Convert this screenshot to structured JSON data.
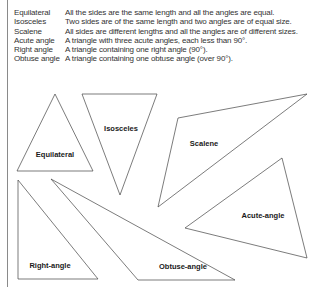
{
  "definitions": [
    {
      "term": "Equilateral",
      "description": "All the sides are the same length and all the angles are equal."
    },
    {
      "term": "Isosceles",
      "description": "Two sides are of the same length and two angles are of equal size."
    },
    {
      "term": "Scalene",
      "description": "All sides are different lengths and all the angles are of different sizes."
    },
    {
      "term": "Acute angle",
      "description": "A triangle with three acute angles, each less than 90°."
    },
    {
      "term": "Right angle",
      "description": "A triangle containing one right angle (90°)."
    },
    {
      "term": "Obtuse angle",
      "description": "A triangle containing one obtuse angle (over 90°)."
    }
  ],
  "triangles": {
    "equilateral": {
      "label": "Equilateral",
      "points": "55,94 17,171 93,171"
    },
    "isosceles": {
      "label": "Isosceles",
      "points": "82,94 157,94 120,195"
    },
    "scalene": {
      "label": "Scalene",
      "points": "178,118 307,94 158,207"
    },
    "acute": {
      "label": "Acute-angle",
      "points": "282,158 185,228 307,258"
    },
    "right": {
      "label": "Right-angle",
      "points": "18,180 18,279 98,279"
    },
    "obtuse": {
      "label": "Obtuse-angle",
      "points": "51,179 138,280 235,280"
    }
  }
}
